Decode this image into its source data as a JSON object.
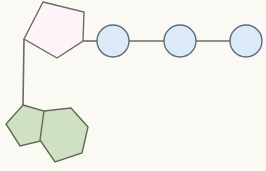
{
  "diagram": {
    "type": "molecular-structure",
    "background_color": "#faf9f4",
    "canvas": {
      "width": 266,
      "height": 171
    },
    "palette": {
      "sugar_fill": "#fdf4f9",
      "sugar_stroke": "#6e6a66",
      "base_fill": "#cfe0c3",
      "base_stroke": "#5f6a57",
      "phosphate_fill": "#dce9f6",
      "phosphate_stroke": "#5d6b7a",
      "bond_stroke": "#6b6b63"
    },
    "stroke_widths": {
      "shape": 1.4,
      "bond": 1.6
    },
    "components": {
      "sugar": {
        "label": "sugar-pentagon",
        "shape": "pentagon",
        "points": "43,2 84,12 83,41 57,58 24,39",
        "fill": "#fdf4f9",
        "stroke": "#6e6a66"
      },
      "base": {
        "label": "nitrogenous-base",
        "shape": "fused-bicyclic-purine",
        "imidazole_points": "23,105 44,111 45,140 20,146 6,124",
        "pyrimidine_points": "44,111 71,108 88,127 82,153 55,162 40,140",
        "fill": "#cfe0c3",
        "stroke": "#5f6a57"
      },
      "phosphates": [
        {
          "label": "phosphate-1",
          "cx": 113,
          "cy": 41,
          "r": 16
        },
        {
          "label": "phosphate-2",
          "cx": 180,
          "cy": 41,
          "r": 16
        },
        {
          "label": "phosphate-3",
          "cx": 246,
          "cy": 41,
          "r": 16
        }
      ],
      "bonds": [
        {
          "label": "bond-sugar-to-phosphate1",
          "x1": 83,
          "y1": 41,
          "x2": 97,
          "y2": 41
        },
        {
          "label": "bond-phosphate1-to-phosphate2",
          "x1": 129,
          "y1": 41,
          "x2": 164,
          "y2": 41
        },
        {
          "label": "bond-phosphate2-to-phosphate3",
          "x1": 196,
          "y1": 41,
          "x2": 230,
          "y2": 41
        },
        {
          "label": "bond-sugar-to-base",
          "x1": 24,
          "y1": 39,
          "x2": 23,
          "y2": 105
        }
      ]
    }
  }
}
